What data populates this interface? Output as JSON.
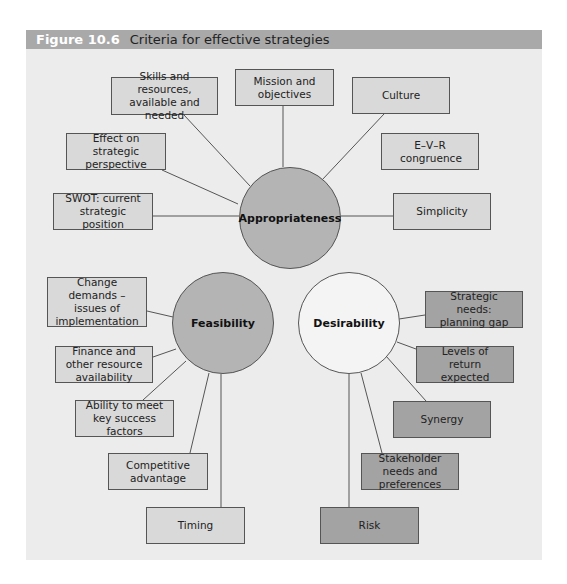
{
  "figure": {
    "number": "Figure 10.6",
    "title": "Criteria for effective strategies"
  },
  "colors": {
    "header_bg": "#a9a9a9",
    "panel_bg": "#ececec",
    "light_box": "#d9d9d9",
    "dark_box": "#a3a3a3",
    "grey_circle": "#b4b4b4",
    "white_circle": "#f4f4f4"
  },
  "hubs": {
    "appropriateness": "Appropriateness",
    "feasibility": "Feasibility",
    "desirability": "Desirability"
  },
  "appropriateness_criteria": [
    "Skills and resources, available and needed",
    "Mission and objectives",
    "Culture",
    "E–V–R congruence",
    "Effect on strategic perspective",
    "SWOT: current strategic position",
    "Simplicity"
  ],
  "feasibility_criteria": [
    "Change demands – issues of implementation",
    "Finance and other resource availability",
    "Ability to meet key success factors",
    "Competitive advantage",
    "Timing"
  ],
  "desirability_criteria": [
    "Strategic needs: planning gap",
    "Levels of return expected",
    "Synergy",
    "Stakeholder needs and preferences",
    "Risk"
  ]
}
